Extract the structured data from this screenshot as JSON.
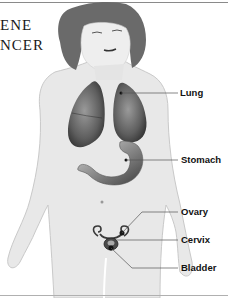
{
  "title": {
    "lines": [
      "ENE",
      "NCER"
    ]
  },
  "figure": {
    "labels": [
      {
        "text": "Lung",
        "x": 184,
        "y": 83
      },
      {
        "text": "Stomach",
        "x": 182,
        "y": 150
      },
      {
        "text": "Ovary",
        "x": 181,
        "y": 204
      },
      {
        "text": "Cervix",
        "x": 181,
        "y": 230
      },
      {
        "text": "Bladder",
        "x": 181,
        "y": 254
      }
    ]
  },
  "colors": {
    "text": "#111111",
    "rule": "#8a8a8a",
    "skin": "#e6e6e6",
    "organ_dark": "#4a4a4a",
    "hair": "#5a5a5a"
  }
}
